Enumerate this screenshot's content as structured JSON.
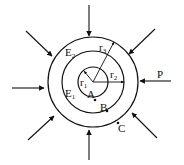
{
  "diagram": {
    "labels": {
      "r1": "r",
      "r1_sub": "1",
      "r2": "r",
      "r2_sub": "2",
      "r3": "r",
      "r3_sub": "3",
      "E1": "E",
      "E1_sub": "1",
      "E2": "E",
      "E2_sub": "2",
      "A": "A",
      "B": "B",
      "C": "C",
      "P": "P"
    },
    "circles": [
      {
        "name": "inner",
        "radius_label": "r1"
      },
      {
        "name": "middle",
        "radius_label": "r2"
      },
      {
        "name": "outer",
        "radius_label": "r3"
      }
    ],
    "pressure_arrows": 8,
    "colors": {
      "stroke": "#111111",
      "background": "#ffffff"
    }
  }
}
